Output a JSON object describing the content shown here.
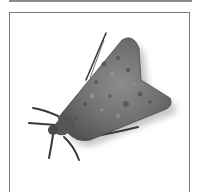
{
  "image": {
    "subject": "moth",
    "alt": "Grayscale illustration of a moth with folded wings",
    "colors": {
      "frame_border": "#7a7a7a",
      "top_rule": "#8a8a8a",
      "wing_base": "#6e6e6e",
      "wing_dark": "#4a4a4a",
      "wing_light": "#9a9a9a",
      "legs": "#3a3a3a",
      "background": "#ffffff"
    }
  }
}
